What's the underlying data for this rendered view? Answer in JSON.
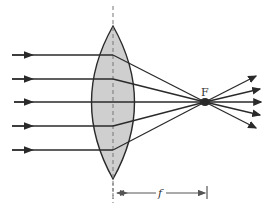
{
  "diagram": {
    "labels": {
      "focal_point": "F",
      "focal_length": "f"
    },
    "colors": {
      "lens_fill": "#cfcfcf",
      "stroke": "#2a2a2a",
      "axis": "#777777"
    },
    "rays_count": 5
  }
}
